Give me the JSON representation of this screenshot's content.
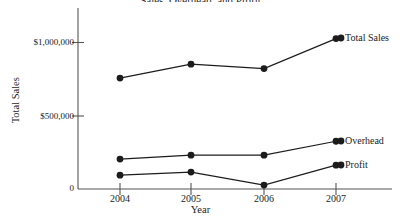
{
  "chart_data": {
    "type": "line",
    "title": "Sales, Overhead, and Profit",
    "xlabel": "Year",
    "ylabel": "Total Sales",
    "categories": [
      "2004",
      "2005",
      "2006",
      "2007"
    ],
    "x": [
      2004,
      2005,
      2006,
      2007
    ],
    "ylim": [
      0,
      1150000
    ],
    "xlim": [
      2003.55,
      2007.55
    ],
    "yticks": [
      0,
      500000,
      1000000
    ],
    "ytick_labels": [
      "0",
      "$500,000",
      "$1,000,000"
    ],
    "grid": false,
    "legend_position": "right-inline",
    "marker": "filled-circle",
    "line_color": "#1c1c1c",
    "series": [
      {
        "name": "Total Sales",
        "values": [
          760000,
          855000,
          825000,
          1030000
        ],
        "label": "Total Sales"
      },
      {
        "name": "Overhead",
        "values": [
          205000,
          232000,
          232000,
          327000
        ],
        "label": "Overhead"
      },
      {
        "name": "Profit",
        "values": [
          95000,
          116000,
          27000,
          163000
        ],
        "label": "Profit"
      }
    ]
  },
  "axes": {
    "y_title": "Total Sales",
    "x_title": "Year",
    "y_tick_labels": [
      "$1,000,000",
      "$500,000",
      "0"
    ],
    "x_tick_labels": [
      "2004",
      "2005",
      "2006",
      "2007"
    ]
  },
  "legend": {
    "items": [
      "Total Sales",
      "Overhead",
      "Profit"
    ]
  },
  "colors": {
    "ink": "#1c1c1c",
    "axis": "#555555",
    "background": "#ffffff"
  }
}
